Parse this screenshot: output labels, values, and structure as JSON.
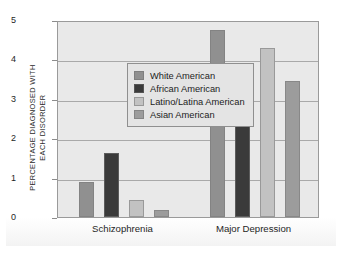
{
  "chart_data": {
    "type": "bar",
    "title": "",
    "xlabel": "",
    "ylabel": "PERCENTAGE DIAGNOSED WITH\nEACH DISORDER",
    "ylim": [
      0,
      5
    ],
    "yticks": [
      "0",
      "1",
      "2",
      "3",
      "4",
      "5"
    ],
    "grid": true,
    "legend_position": "upper-left-inside",
    "categories": [
      "Schizophrenia",
      "Major Depression"
    ],
    "series": [
      {
        "name": "White American",
        "values": [
          0.9,
          4.75
        ],
        "color": "#909090"
      },
      {
        "name": "African American",
        "values": [
          1.63,
          2.9
        ],
        "color": "#3a3a3a"
      },
      {
        "name": "Latino/Latina American",
        "values": [
          0.42,
          4.3
        ],
        "color": "#c2c2c2"
      },
      {
        "name": "Asian American",
        "values": [
          0.18,
          3.45
        ],
        "color": "#9c9c9c"
      }
    ]
  },
  "legend": {
    "items": [
      {
        "label": "White American"
      },
      {
        "label": "African American"
      },
      {
        "label": "Latino/Latina American"
      },
      {
        "label": "Asian American"
      }
    ]
  }
}
